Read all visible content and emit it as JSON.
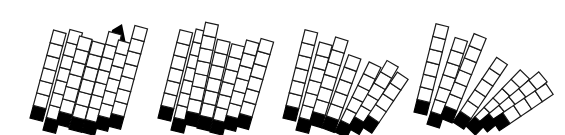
{
  "figure": {
    "colors": {
      "block_fill": "#ffffff",
      "block_stroke": "#1a1a1a",
      "base_block": "#000000"
    },
    "block_size": 13,
    "panels": [
      {
        "id": "panel-1",
        "origin": [
          30,
          118
        ],
        "columns": [
          {
            "dx": 0,
            "dy": 0,
            "count": 7,
            "angle": 15,
            "base_black": true
          },
          {
            "dx": 13,
            "dy": 12,
            "count": 8,
            "angle": 15,
            "base_black": true
          },
          {
            "dx": 26,
            "dy": 6,
            "count": 7,
            "angle": 15,
            "base_black": true
          },
          {
            "dx": 39,
            "dy": 11,
            "count": 7,
            "angle": 15,
            "base_black": true
          },
          {
            "dx": 52,
            "dy": 14,
            "count": 8,
            "angle": 15,
            "base_black": true
          },
          {
            "dx": 65,
            "dy": 10,
            "count": 7,
            "angle": 15,
            "base_black": true
          },
          {
            "dx": 78,
            "dy": 8,
            "count": 8,
            "angle": 15,
            "base_black": true
          }
        ],
        "shadow": [
          [
            112,
            30
          ],
          [
            122,
            24
          ],
          [
            130,
            64
          ],
          [
            122,
            60
          ],
          [
            124,
            105
          ],
          [
            108,
            122
          ],
          [
            104,
            82
          ]
        ]
      },
      {
        "id": "panel-2",
        "origin": [
          158,
          118
        ],
        "columns": [
          {
            "dx": 0,
            "dy": 0,
            "count": 7,
            "angle": 14,
            "base_black": true
          },
          {
            "dx": 13,
            "dy": 12,
            "count": 8,
            "angle": 14,
            "base_black": true
          },
          {
            "dx": 26,
            "dy": 6,
            "count": 8,
            "angle": 12,
            "base_black": true
          },
          {
            "dx": 39,
            "dy": 10,
            "count": 7,
            "angle": 13,
            "base_black": true
          },
          {
            "dx": 52,
            "dy": 14,
            "count": 7,
            "angle": 14,
            "base_black": true
          },
          {
            "dx": 65,
            "dy": 10,
            "count": 7,
            "angle": 15,
            "base_black": true
          },
          {
            "dx": 78,
            "dy": 8,
            "count": 7,
            "angle": 16,
            "base_black": true
          }
        ],
        "shadow": []
      },
      {
        "id": "panel-3",
        "origin": [
          283,
          118
        ],
        "columns": [
          {
            "dx": 0,
            "dy": 0,
            "count": 7,
            "angle": 14,
            "base_black": true
          },
          {
            "dx": 13,
            "dy": 12,
            "count": 7,
            "angle": 15,
            "base_black": true
          },
          {
            "dx": 26,
            "dy": 6,
            "count": 7,
            "angle": 17,
            "base_black": true
          },
          {
            "dx": 39,
            "dy": 10,
            "count": 6,
            "angle": 20,
            "base_black": true
          },
          {
            "dx": 52,
            "dy": 14,
            "count": 6,
            "angle": 26,
            "base_black": true
          },
          {
            "dx": 65,
            "dy": 10,
            "count": 6,
            "angle": 30,
            "base_black": true
          },
          {
            "dx": 78,
            "dy": 8,
            "count": 5,
            "angle": 34,
            "base_black": true
          }
        ],
        "shadow": []
      },
      {
        "id": "panel-4",
        "origin": [
          414,
          112
        ],
        "columns": [
          {
            "dx": 0,
            "dy": 0,
            "count": 7,
            "angle": 14,
            "base_black": true
          },
          {
            "dx": 13,
            "dy": 12,
            "count": 7,
            "angle": 18,
            "base_black": true
          },
          {
            "dx": 26,
            "dy": 6,
            "count": 7,
            "angle": 22,
            "base_black": true
          },
          {
            "dx": 39,
            "dy": 10,
            "count": 6,
            "angle": 34,
            "base_black": true
          },
          {
            "dx": 52,
            "dy": 14,
            "count": 6,
            "angle": 44,
            "base_black": true
          },
          {
            "dx": 65,
            "dy": 10,
            "count": 6,
            "angle": 50,
            "base_black": true
          },
          {
            "dx": 78,
            "dy": 8,
            "count": 5,
            "angle": 56,
            "base_black": true
          }
        ],
        "shadow": []
      }
    ]
  }
}
